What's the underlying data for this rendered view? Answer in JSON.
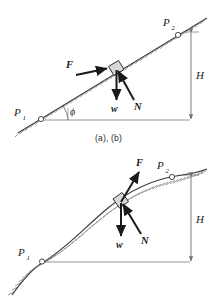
{
  "figure": {
    "panels": [
      {
        "id": "ab",
        "caption": "(a), (b)",
        "surface_type": "straight-incline",
        "labels": {
          "p1": "P",
          "p1_sub": "1",
          "p2": "P",
          "p2_sub": "2",
          "height": "H",
          "angle": "ϕ",
          "force": "F",
          "weight": "w",
          "normal": "N"
        }
      },
      {
        "id": "c",
        "caption": "(c)",
        "surface_type": "curved-ramp",
        "labels": {
          "p1": "P",
          "p1_sub": "1",
          "p2": "P",
          "p2_sub": "2",
          "height": "H",
          "force": "F",
          "weight": "w",
          "normal": "N"
        }
      }
    ]
  },
  "colors": {
    "ink": "#1a1a1a",
    "line": "#3a3a3a",
    "hatch": "#6e6e6e",
    "dimension": "#707070",
    "block_fill": "#d8d8d8",
    "background": "#ffffff"
  }
}
